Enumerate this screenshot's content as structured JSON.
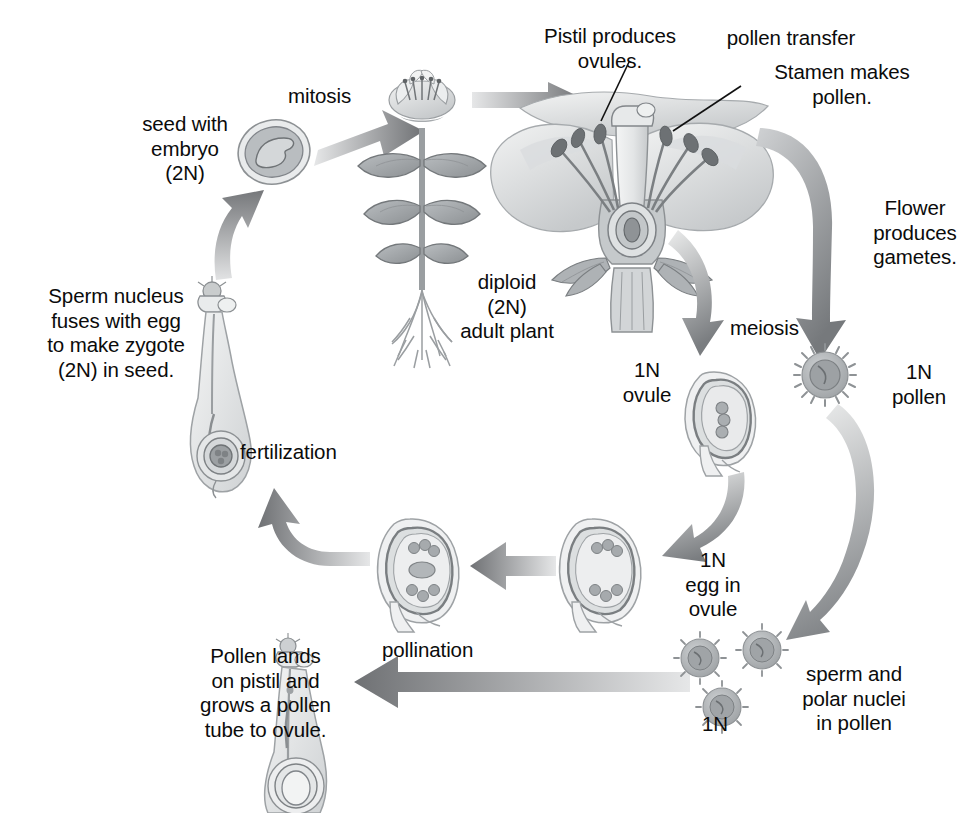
{
  "diagram": {
    "palette": {
      "text": "#0b0b0b",
      "arrow_dark": "#6f7174",
      "arrow_mid": "#8e9195",
      "arrow_light": "#c9cbcd",
      "arrow_pale": "#e8e9ea",
      "organ_fill": "#eceeef",
      "organ_fill_mid": "#d4d7d9",
      "organ_fill_dark": "#a9adb0",
      "organ_line": "#8d9194",
      "background": "#ffffff"
    },
    "labels": [
      {
        "id": "pistil-produces-ovules",
        "text": "Pistil produces\novules.",
        "x": 520,
        "y": 24,
        "w": 180,
        "align": "center"
      },
      {
        "id": "pollen-transfer",
        "text": "pollen transfer",
        "x": 706,
        "y": 26,
        "w": 170,
        "align": "center"
      },
      {
        "id": "stamen-makes-pollen",
        "text": "Stamen makes\npollen.",
        "x": 742,
        "y": 60,
        "w": 200,
        "align": "center"
      },
      {
        "id": "mitosis",
        "text": "mitosis",
        "x": 288,
        "y": 84,
        "w": 110,
        "align": "left"
      },
      {
        "id": "seed-with-embryo",
        "text": "seed with\nembryo\n(2N)",
        "x": 115,
        "y": 112,
        "w": 140,
        "align": "center"
      },
      {
        "id": "flower-produces-gametes",
        "text": "Flower\nproduces\ngametes.",
        "x": 857,
        "y": 196,
        "w": 116,
        "align": "center"
      },
      {
        "id": "diploid-adult-plant",
        "text": "diploid\n(2N)\nadult plant",
        "x": 432,
        "y": 270,
        "w": 150,
        "align": "center"
      },
      {
        "id": "sperm-nucleus-fuses",
        "text": "Sperm nucleus\nfuses with egg\nto make zygote\n(2N) in seed.",
        "x": 26,
        "y": 284,
        "w": 180,
        "align": "center"
      },
      {
        "id": "meiosis",
        "text": "meiosis",
        "x": 730,
        "y": 316,
        "w": 110,
        "align": "left"
      },
      {
        "id": "one-n-ovule",
        "text": "1N\novule",
        "x": 608,
        "y": 358,
        "w": 78,
        "align": "center"
      },
      {
        "id": "one-n-pollen",
        "text": "1N\npollen",
        "x": 874,
        "y": 360,
        "w": 90,
        "align": "center"
      },
      {
        "id": "fertilization",
        "text": "fertilization",
        "x": 240,
        "y": 440,
        "w": 150,
        "align": "left"
      },
      {
        "id": "one-n-egg-in-ovule",
        "text": "1N\negg in\novule",
        "x": 668,
        "y": 548,
        "w": 90,
        "align": "center"
      },
      {
        "id": "pollination",
        "text": "pollination",
        "x": 382,
        "y": 638,
        "w": 140,
        "align": "left"
      },
      {
        "id": "sperm-polar-nuclei",
        "text": "sperm and\npolar nuclei\nin pollen",
        "x": 774,
        "y": 662,
        "w": 160,
        "align": "center"
      },
      {
        "id": "pollen-lands-on-pistil",
        "text": "Pollen lands\non pistil and\ngrows a pollen\ntube to ovule.",
        "x": 178,
        "y": 644,
        "w": 175,
        "align": "center"
      },
      {
        "id": "one-n-bottom",
        "text": "1N",
        "x": 690,
        "y": 712,
        "w": 50,
        "align": "center"
      }
    ],
    "stages": [
      {
        "id": "seed-with-embryo",
        "label": "seed with embryo (2N)",
        "ploidy": "2N"
      },
      {
        "id": "adult-plant",
        "label": "diploid (2N) adult plant",
        "ploidy": "2N"
      },
      {
        "id": "flower",
        "label": "flower with pistil and stamen",
        "ploidy": "2N"
      },
      {
        "id": "ovule",
        "label": "1N ovule",
        "ploidy": "1N"
      },
      {
        "id": "pollen",
        "label": "1N pollen",
        "ploidy": "1N"
      },
      {
        "id": "egg-in-ovule",
        "label": "1N egg in ovule",
        "ploidy": "1N"
      },
      {
        "id": "mature-embryo-sac",
        "label": "embryo sac in ovule",
        "ploidy": "1N"
      },
      {
        "id": "pollen-grains",
        "label": "sperm and polar nuclei in pollen (1N)",
        "ploidy": "1N"
      },
      {
        "id": "pollen-tube-pistil",
        "label": "pistil with growing pollen tube",
        "ploidy": "1N"
      },
      {
        "id": "fertilized-pistil",
        "label": "pistil at fertilization",
        "ploidy": "2N"
      }
    ],
    "processes": [
      "mitosis",
      "pollen transfer",
      "meiosis",
      "pollination",
      "fertilization"
    ],
    "leaders": [
      {
        "id": "leader-pistil",
        "from": [
          628,
          62
        ],
        "to": [
          600,
          122
        ]
      },
      {
        "id": "leader-stamen",
        "from": [
          740,
          86
        ],
        "to": [
          672,
          132
        ]
      }
    ]
  }
}
